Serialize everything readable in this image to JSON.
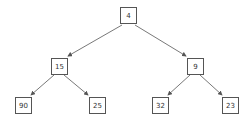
{
  "diagram": {
    "type": "binary-tree",
    "nodes": [
      {
        "id": "n4",
        "label": "4",
        "x": 120,
        "y": 7
      },
      {
        "id": "n15",
        "label": "15",
        "x": 51,
        "y": 58
      },
      {
        "id": "n9",
        "label": "9",
        "x": 187,
        "y": 58
      },
      {
        "id": "n90",
        "label": "90",
        "x": 15,
        "y": 97
      },
      {
        "id": "n25",
        "label": "25",
        "x": 89,
        "y": 97
      },
      {
        "id": "n32",
        "label": "32",
        "x": 152,
        "y": 97
      },
      {
        "id": "n23",
        "label": "23",
        "x": 222,
        "y": 97
      }
    ],
    "edges": [
      {
        "from": "4",
        "to": "15"
      },
      {
        "from": "4",
        "to": "9"
      },
      {
        "from": "15",
        "to": "90"
      },
      {
        "from": "15",
        "to": "25"
      },
      {
        "from": "9",
        "to": "32"
      },
      {
        "from": "9",
        "to": "23"
      }
    ],
    "colors": {
      "line": "#555555",
      "box_border": "#555555",
      "text": "#333333"
    }
  }
}
